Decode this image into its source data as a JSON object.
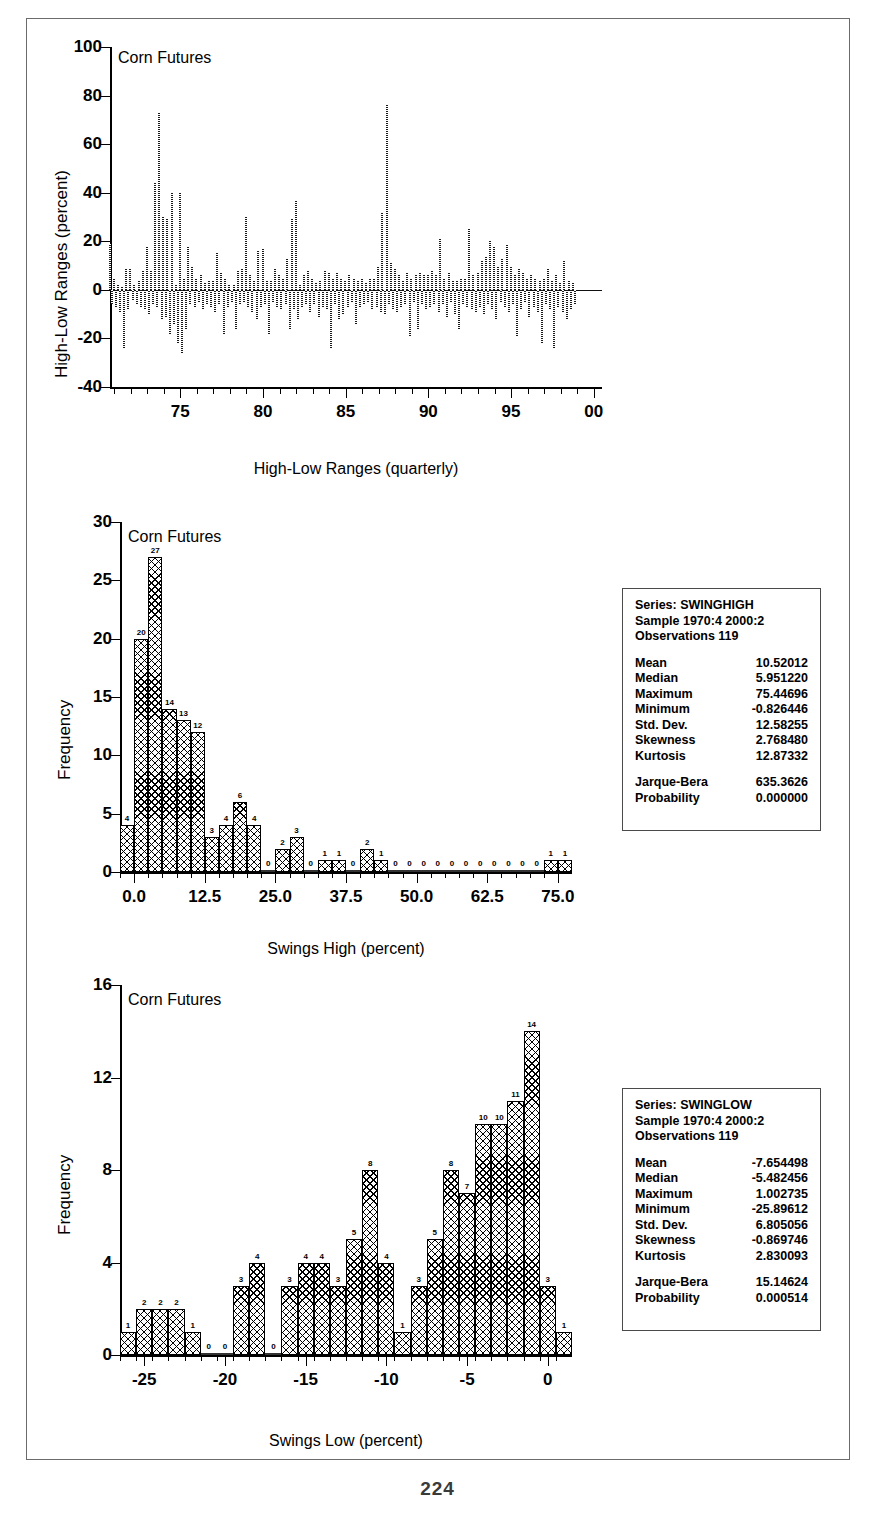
{
  "page": {
    "number": "224"
  },
  "charts": [
    {
      "id": "high-low-ranges",
      "annotation": "Corn Futures",
      "ylabel": "High-Low Ranges (percent)",
      "xlabel": "High-Low Ranges (quarterly)",
      "yticks": [
        "100",
        "80",
        "60",
        "40",
        "20",
        "0",
        "-20",
        "-40"
      ],
      "xticks": [
        "75",
        "80",
        "85",
        "90",
        "95",
        "00"
      ]
    },
    {
      "id": "swings-high",
      "annotation": "Corn Futures",
      "ylabel": "Frequency",
      "xlabel": "Swings High (percent)",
      "yticks": [
        "30",
        "25",
        "20",
        "15",
        "10",
        "5",
        "0"
      ],
      "xticks": [
        "0.0",
        "12.5",
        "25.0",
        "37.5",
        "50.0",
        "62.5",
        "75.0"
      ]
    },
    {
      "id": "swings-low",
      "annotation": "Corn Futures",
      "ylabel": "Frequency",
      "xlabel": "Swings Low (percent)",
      "yticks": [
        "16",
        "12",
        "8",
        "4",
        "0"
      ],
      "xticks": [
        "-25",
        "-20",
        "-15",
        "-10",
        "-5",
        "0"
      ]
    }
  ],
  "stats_high": {
    "series": "Series: SWINGHIGH",
    "sample": "Sample 1970:4 2000:2",
    "observations": "Observations 119",
    "rows": [
      {
        "key": "Mean",
        "value": "10.52012"
      },
      {
        "key": "Median",
        "value": "5.951220"
      },
      {
        "key": "Maximum",
        "value": "75.44696"
      },
      {
        "key": "Minimum",
        "value": "-0.826446"
      },
      {
        "key": "Std. Dev.",
        "value": "12.58255"
      },
      {
        "key": "Skewness",
        "value": "2.768480"
      },
      {
        "key": "Kurtosis",
        "value": "12.87332"
      }
    ],
    "tests": [
      {
        "key": "Jarque-Bera",
        "value": "635.3626"
      },
      {
        "key": "Probability",
        "value": "0.000000"
      }
    ]
  },
  "stats_low": {
    "series": "Series: SWINGLOW",
    "sample": "Sample 1970:4 2000:2",
    "observations": "Observations 119",
    "rows": [
      {
        "key": "Mean",
        "value": "-7.654498"
      },
      {
        "key": "Median",
        "value": "-5.482456"
      },
      {
        "key": "Maximum",
        "value": "1.002735"
      },
      {
        "key": "Minimum",
        "value": "-25.89612"
      },
      {
        "key": "Std. Dev.",
        "value": "6.805056"
      },
      {
        "key": "Skewness",
        "value": "-0.869746"
      },
      {
        "key": "Kurtosis",
        "value": "2.830093"
      }
    ],
    "tests": [
      {
        "key": "Jarque-Bera",
        "value": "15.14624"
      },
      {
        "key": "Probability",
        "value": "0.000514"
      }
    ]
  },
  "chart_data": [
    {
      "type": "bar",
      "id": "high-low-ranges",
      "title": "Corn Futures",
      "xlabel": "High-Low Ranges (quarterly)",
      "ylabel": "High-Low Ranges (percent)",
      "ylim": [
        -40,
        100
      ],
      "xlim": [
        1970.75,
        2000.5
      ],
      "yticks": [
        -40,
        -20,
        0,
        20,
        40,
        60,
        80,
        100
      ],
      "xticks": [
        1975,
        1980,
        1985,
        1990,
        1995,
        2000
      ],
      "grid": false,
      "legend": "none",
      "note": "Quarterly high-low percentage ranges; positive = swing high, negative = swing low, plotted as alternating vertical bars from zero.",
      "x": [
        1970.75,
        1971.0,
        1971.25,
        1971.5,
        1971.75,
        1972.0,
        1972.25,
        1972.5,
        1972.75,
        1973.0,
        1973.25,
        1973.5,
        1973.75,
        1974.0,
        1974.25,
        1974.5,
        1974.75,
        1975.0,
        1975.25,
        1975.5,
        1975.75,
        1976.0,
        1976.25,
        1976.5,
        1976.75,
        1977.0,
        1977.25,
        1977.5,
        1977.75,
        1978.0,
        1978.25,
        1978.5,
        1978.75,
        1979.0,
        1979.25,
        1979.5,
        1979.75,
        1980.0,
        1980.25,
        1980.5,
        1980.75,
        1981.0,
        1981.25,
        1981.5,
        1981.75,
        1982.0,
        1982.25,
        1982.5,
        1982.75,
        1983.0,
        1983.25,
        1983.5,
        1983.75,
        1984.0,
        1984.25,
        1984.5,
        1984.75,
        1985.0,
        1985.25,
        1985.5,
        1985.75,
        1986.0,
        1986.25,
        1986.5,
        1986.75,
        1987.0,
        1987.25,
        1987.5,
        1987.75,
        1988.0,
        1988.25,
        1988.5,
        1988.75,
        1989.0,
        1989.25,
        1989.5,
        1989.75,
        1990.0,
        1990.25,
        1990.5,
        1990.75,
        1991.0,
        1991.25,
        1991.5,
        1991.75,
        1992.0,
        1992.25,
        1992.5,
        1992.75,
        1993.0,
        1993.25,
        1993.5,
        1993.75,
        1994.0,
        1994.25,
        1994.5,
        1994.75,
        1995.0,
        1995.25,
        1995.5,
        1995.75,
        1996.0,
        1996.25,
        1996.5,
        1996.75,
        1997.0,
        1997.25,
        1997.5,
        1997.75,
        1998.0,
        1998.25,
        1998.5,
        1998.75,
        1999.0,
        1999.25,
        1999.5,
        1999.75,
        2000.0,
        2000.25
      ],
      "swing_high": [
        19,
        5,
        2,
        1,
        9,
        9,
        2,
        4,
        8,
        18,
        8,
        44,
        73,
        30,
        29,
        40,
        2,
        40,
        5,
        18,
        10,
        5,
        6,
        3,
        4,
        4,
        15,
        7,
        5,
        2,
        2,
        8,
        9,
        30,
        6,
        4,
        16,
        17,
        4,
        4,
        9,
        6,
        5,
        13,
        29,
        37,
        2,
        6,
        8,
        5,
        3,
        4,
        8,
        7,
        5,
        7,
        5,
        4,
        6,
        5,
        4,
        5,
        3,
        5,
        5,
        10,
        32,
        76,
        11,
        9,
        6,
        4,
        7,
        5,
        6,
        7,
        6,
        6,
        8,
        6,
        21,
        5,
        7,
        4,
        4,
        5,
        5,
        25,
        6,
        7,
        12,
        14,
        20,
        18,
        10,
        13,
        19,
        10,
        6,
        9,
        7,
        5,
        6,
        5,
        4,
        5,
        9,
        4,
        6,
        3,
        12,
        4,
        3
      ],
      "swing_low": [
        -6,
        -7,
        -9,
        -24,
        -8,
        -4,
        -6,
        -7,
        -8,
        -10,
        -6,
        -7,
        -12,
        -11,
        -18,
        -14,
        -22,
        -26,
        -16,
        -6,
        -7,
        -5,
        -8,
        -6,
        -7,
        -9,
        -6,
        -18,
        -7,
        -5,
        -16,
        -6,
        -5,
        -7,
        -9,
        -12,
        -7,
        -6,
        -18,
        -5,
        -7,
        -8,
        -6,
        -16,
        -8,
        -12,
        -7,
        -6,
        -9,
        -6,
        -11,
        -7,
        -8,
        -24,
        -6,
        -12,
        -10,
        -7,
        -5,
        -14,
        -7,
        -6,
        -5,
        -8,
        -7,
        -9,
        -10,
        -6,
        -8,
        -9,
        -7,
        -6,
        -19,
        -5,
        -16,
        -6,
        -8,
        -7,
        -6,
        -9,
        -6,
        -11,
        -5,
        -10,
        -16,
        -6,
        -7,
        -8,
        -9,
        -7,
        -10,
        -6,
        -8,
        -12,
        -5,
        -7,
        -9,
        -6,
        -19,
        -8,
        -5,
        -11,
        -7,
        -9,
        -22,
        -6,
        -8,
        -24,
        -7,
        -9,
        -12,
        -8,
        -6
      ]
    },
    {
      "type": "bar",
      "id": "swings-high",
      "title": "Corn Futures",
      "xlabel": "Swings High (percent)",
      "ylabel": "Frequency",
      "ylim": [
        0,
        30
      ],
      "xlim": [
        -2.5,
        77.5
      ],
      "yticks": [
        0,
        5,
        10,
        15,
        20,
        25,
        30
      ],
      "xticks": [
        0.0,
        12.5,
        25.0,
        37.5,
        50.0,
        62.5,
        75.0
      ],
      "grid": false,
      "legend": "none",
      "bin_width": 2.5,
      "bin_centers": [
        -1.25,
        1.25,
        3.75,
        6.25,
        8.75,
        11.25,
        13.75,
        16.25,
        18.75,
        21.25,
        23.75,
        26.25,
        28.75,
        31.25,
        33.75,
        36.25,
        38.75,
        41.25,
        43.75,
        46.25,
        48.75,
        51.25,
        53.75,
        56.25,
        58.75,
        61.25,
        63.75,
        66.25,
        68.75,
        71.25,
        73.75,
        76.25
      ],
      "values": [
        4,
        20,
        27,
        14,
        13,
        12,
        3,
        4,
        6,
        4,
        0,
        2,
        3,
        0,
        1,
        1,
        0,
        2,
        1,
        0,
        0,
        0,
        0,
        0,
        0,
        0,
        0,
        0,
        0,
        0,
        1,
        1
      ]
    },
    {
      "type": "bar",
      "id": "swings-low",
      "title": "Corn Futures",
      "xlabel": "Swings Low (percent)",
      "ylabel": "Frequency",
      "ylim": [
        0,
        16
      ],
      "xlim": [
        -26.5,
        1.5
      ],
      "yticks": [
        0,
        4,
        8,
        12,
        16
      ],
      "xticks": [
        -25,
        -20,
        -15,
        -10,
        -5,
        0
      ],
      "grid": false,
      "legend": "none",
      "bin_width": 1.0,
      "bin_centers": [
        -26,
        -25,
        -24,
        -23,
        -22,
        -21,
        -20,
        -19,
        -18,
        -17,
        -16,
        -15,
        -14,
        -13,
        -12,
        -11,
        -10,
        -9,
        -8,
        -7,
        -6,
        -5,
        -4,
        -3,
        -2,
        -1,
        0,
        1
      ],
      "values": [
        1,
        2,
        2,
        2,
        1,
        0,
        0,
        3,
        4,
        0,
        3,
        4,
        4,
        3,
        5,
        8,
        4,
        1,
        3,
        5,
        8,
        7,
        10,
        10,
        11,
        14,
        3,
        1
      ]
    }
  ]
}
